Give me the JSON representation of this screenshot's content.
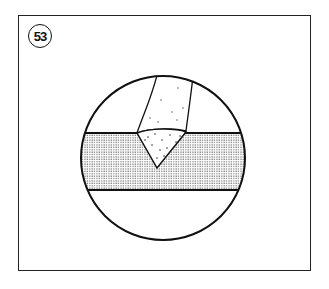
{
  "figure": {
    "number_label": "53",
    "parts": [
      "weld-electrode",
      "v-groove-weld-bead",
      "base-plate"
    ],
    "colors": {
      "line": "#111111",
      "background": "#ffffff",
      "stipple": "#555555"
    }
  }
}
